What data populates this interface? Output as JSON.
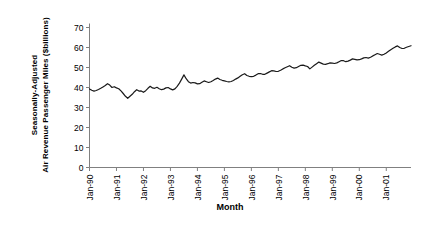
{
  "chart_data": {
    "type": "line",
    "title": "",
    "xlabel": "Month",
    "ylabel_line1": "Seasonally-Adjusted",
    "ylabel_line2": "Air Revenue Passenger Miles ($billions)",
    "ylim": [
      0,
      70
    ],
    "yticks": [
      0,
      10,
      20,
      30,
      40,
      50,
      60,
      70
    ],
    "ytick_labels": [
      "0",
      "10",
      "20",
      "30",
      "40",
      "50",
      "60",
      "70"
    ],
    "xtick_labels": [
      "Jan-90",
      "Jan-91",
      "Jan-92",
      "Jan-93",
      "Jan-94",
      "Jan-95",
      "Jan-96",
      "Jan-97",
      "Jan-98",
      "Jan-99",
      "Jan-00",
      "Jan-01"
    ],
    "grid": false,
    "legend": false,
    "line_color": "#1a1a1a",
    "line_width": 1.2,
    "x_start": "Jan-90",
    "x_end": "Jun-01",
    "n_points": 138,
    "series": [
      {
        "name": "Air Revenue Passenger Miles",
        "values": [
          39.3,
          38.6,
          38.2,
          38.5,
          39.0,
          39.6,
          40.3,
          41.0,
          41.9,
          41.2,
          40.0,
          40.4,
          39.8,
          39.4,
          38.3,
          37.0,
          35.6,
          34.6,
          35.6,
          36.6,
          37.9,
          38.9,
          38.2,
          38.3,
          37.6,
          38.4,
          39.6,
          40.6,
          39.8,
          39.6,
          40.1,
          39.4,
          38.9,
          39.2,
          39.8,
          40.0,
          39.3,
          38.8,
          39.3,
          40.6,
          42.2,
          44.2,
          46.3,
          44.4,
          42.9,
          42.2,
          42.5,
          42.3,
          41.8,
          41.9,
          42.6,
          43.3,
          42.9,
          42.5,
          42.9,
          43.5,
          44.2,
          44.7,
          44.0,
          43.6,
          43.3,
          43.0,
          42.8,
          43.0,
          43.5,
          44.2,
          44.8,
          45.6,
          46.4,
          46.9,
          46.0,
          45.6,
          45.4,
          45.6,
          46.2,
          46.9,
          47.0,
          46.6,
          46.6,
          47.2,
          47.8,
          48.4,
          48.3,
          48.0,
          48.1,
          48.6,
          49.3,
          49.9,
          50.4,
          50.9,
          50.1,
          49.7,
          49.9,
          50.5,
          51.1,
          51.2,
          50.8,
          50.5,
          49.3,
          50.2,
          51.1,
          51.9,
          52.7,
          52.2,
          51.7,
          51.6,
          51.9,
          52.3,
          52.2,
          52.0,
          52.3,
          52.9,
          53.5,
          53.4,
          52.9,
          53.2,
          53.7,
          54.3,
          54.1,
          53.8,
          53.9,
          54.3,
          54.8,
          55.0,
          54.7,
          55.1,
          55.8,
          56.4,
          57.0,
          56.6,
          56.2,
          56.6,
          57.3,
          58.1,
          58.9,
          59.6,
          60.3,
          60.8,
          60.0,
          59.5,
          59.6,
          60.1,
          60.5,
          60.9
        ]
      }
    ]
  }
}
